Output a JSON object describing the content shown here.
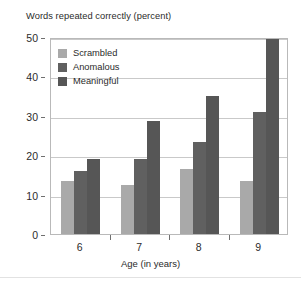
{
  "chart_data": {
    "type": "bar",
    "title": "Words repeated correctly (percent)",
    "xlabel": "Age (in years)",
    "ylabel": "",
    "categories": [
      "6",
      "7",
      "8",
      "9"
    ],
    "series": [
      {
        "name": "Scrambled",
        "color": "#a9a9a9",
        "values": [
          13.5,
          12.5,
          16.5,
          13.5
        ]
      },
      {
        "name": "Anomalous",
        "color": "#606060",
        "values": [
          16.0,
          19.0,
          23.3,
          31.0
        ]
      },
      {
        "name": "Meaningful",
        "color": "#565656",
        "values": [
          19.0,
          28.7,
          35.0,
          49.5
        ]
      }
    ],
    "ylim": [
      0,
      50
    ],
    "yticks": [
      0,
      10,
      20,
      30,
      40,
      50
    ],
    "ytick_labels": [
      "0",
      "10",
      "20",
      "30",
      "40",
      "50"
    ],
    "grid": true,
    "legend_position": "upper-left-inside"
  },
  "legend": {
    "items": [
      {
        "label": "Scrambled"
      },
      {
        "label": "Anomalous"
      },
      {
        "label": "Meaningful"
      }
    ]
  },
  "axes": {
    "x_title": "Age (in years)",
    "x_labels": [
      "6",
      "7",
      "8",
      "9"
    ],
    "y_labels": [
      "50",
      "40",
      "30",
      "20",
      "10",
      "0"
    ]
  }
}
